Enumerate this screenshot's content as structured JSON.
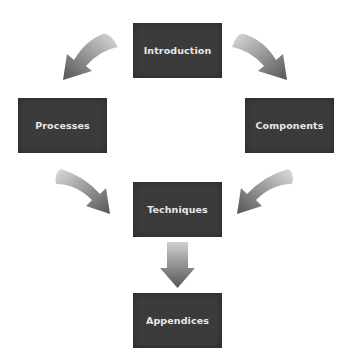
{
  "diagram": {
    "nodes": [
      {
        "id": "introduction",
        "label": "Introduction"
      },
      {
        "id": "processes",
        "label": "Processes"
      },
      {
        "id": "components",
        "label": "Components"
      },
      {
        "id": "techniques",
        "label": "Techniques"
      },
      {
        "id": "appendices",
        "label": "Appendices"
      }
    ],
    "edges": [
      {
        "from": "introduction",
        "to": "processes"
      },
      {
        "from": "introduction",
        "to": "components"
      },
      {
        "from": "processes",
        "to": "techniques"
      },
      {
        "from": "components",
        "to": "techniques"
      },
      {
        "from": "techniques",
        "to": "appendices"
      }
    ],
    "colors": {
      "box": "#3b3b3b",
      "text": "#e8e8e8",
      "arrow_light": "#d8d8d8",
      "arrow_dark": "#5a5a5a"
    }
  }
}
